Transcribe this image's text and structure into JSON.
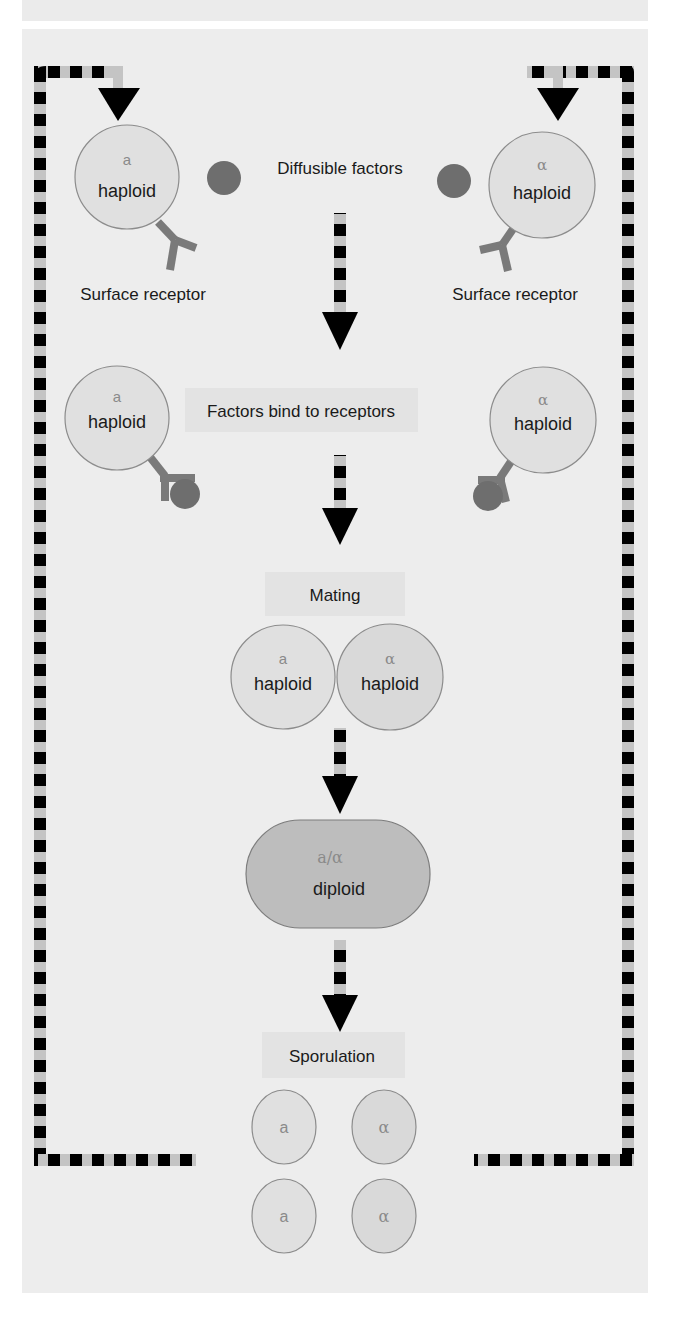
{
  "colors": {
    "background": "#ededed",
    "cell_fill": "#e0e0e0",
    "cell_stroke": "#8c8c8c",
    "diploid_fill": "#bdbdbd",
    "factor_dot": "#6e6e6e",
    "receptor": "#7a7a7a",
    "label_box": "#e3e3e3",
    "dash_dark": "#000000",
    "dash_light": "#bfbfbf"
  },
  "row1": {
    "left_cell": {
      "mating_type": "a",
      "label": "haploid"
    },
    "right_cell": {
      "mating_type": "α",
      "label": "haploid"
    },
    "factors_label": "Diffusible factors",
    "left_receptor_label": "Surface receptor",
    "right_receptor_label": "Surface receptor"
  },
  "row2": {
    "left_cell": {
      "mating_type": "a",
      "label": "haploid"
    },
    "right_cell": {
      "mating_type": "α",
      "label": "haploid"
    },
    "step_label": "Factors bind to receptors"
  },
  "row3": {
    "step_label": "Mating",
    "left_cell": {
      "mating_type": "a",
      "label": "haploid"
    },
    "right_cell": {
      "mating_type": "α",
      "label": "haploid"
    }
  },
  "row4": {
    "diploid": {
      "mating_type": "a/α",
      "label": "diploid"
    }
  },
  "row5": {
    "step_label": "Sporulation",
    "spores": [
      {
        "mating_type": "a"
      },
      {
        "mating_type": "α"
      },
      {
        "mating_type": "a"
      },
      {
        "mating_type": "α"
      }
    ]
  }
}
